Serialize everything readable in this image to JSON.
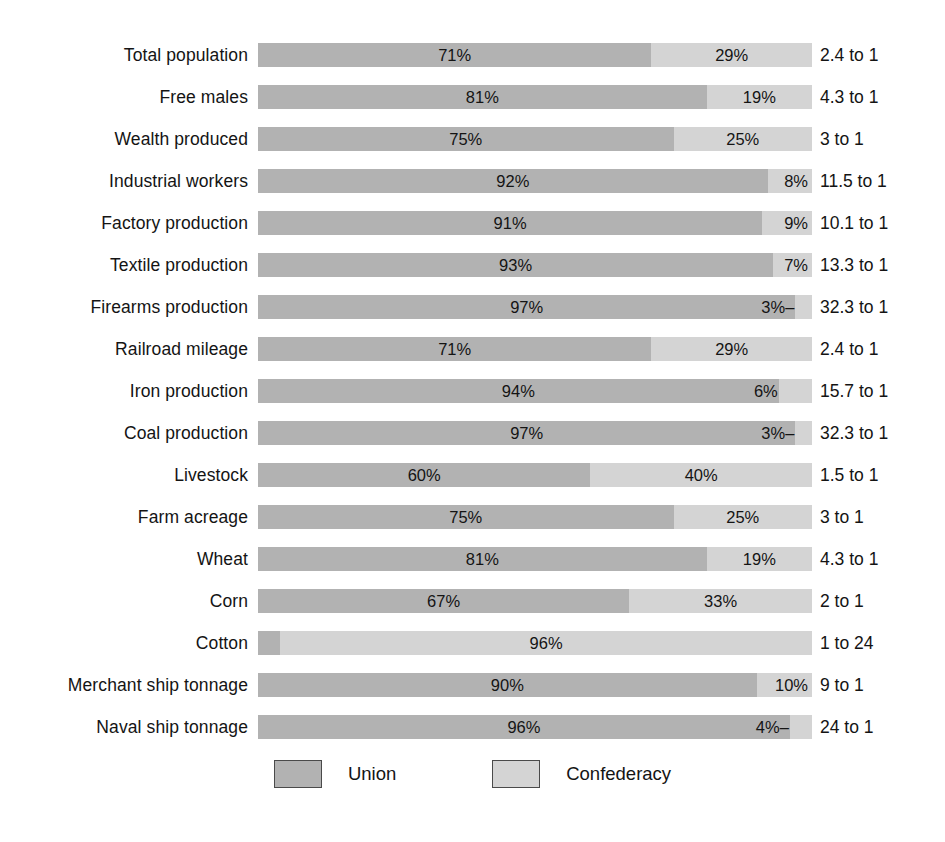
{
  "chart_data": {
    "type": "bar",
    "subtype": "stacked-horizontal-100",
    "title": "",
    "xlabel": "",
    "ylabel": "",
    "xlim": [
      0,
      100
    ],
    "grid": false,
    "legend_position": "bottom-center",
    "categories": [
      "Total population",
      "Free males",
      "Wealth produced",
      "Industrial workers",
      "Factory production",
      "Textile production",
      "Firearms production",
      "Railroad mileage",
      "Iron production",
      "Coal production",
      "Livestock",
      "Farm acreage",
      "Wheat",
      "Corn",
      "Cotton",
      "Merchant ship tonnage",
      "Naval ship tonnage"
    ],
    "series": [
      {
        "name": "Union",
        "color": "#b2b2b2",
        "values": [
          71,
          81,
          75,
          92,
          91,
          93,
          97,
          71,
          94,
          97,
          60,
          75,
          81,
          67,
          4,
          90,
          96
        ]
      },
      {
        "name": "Confederacy",
        "color": "#d4d4d4",
        "values": [
          29,
          19,
          25,
          8,
          9,
          7,
          3,
          29,
          6,
          3,
          40,
          25,
          19,
          33,
          96,
          10,
          4
        ]
      }
    ],
    "ratios": [
      "2.4 to 1",
      "4.3 to 1",
      "3 to 1",
      "11.5 to 1",
      "10.1 to 1",
      "13.3 to 1",
      "32.3 to 1",
      "2.4 to 1",
      "15.7 to 1",
      "32.3 to 1",
      "1.5 to 1",
      "3 to 1",
      "4.3 to 1",
      "2 to 1",
      "1 to 24",
      "9 to 1",
      "24 to 1"
    ]
  },
  "rows": [
    {
      "label": "Total population",
      "union_pct": 71,
      "conf_pct": 29,
      "union_label": "71%",
      "conf_label": "29%",
      "union_label_style": "pct-center",
      "conf_label_style": "pct-center",
      "ratio": "2.4 to 1"
    },
    {
      "label": "Free males",
      "union_pct": 81,
      "conf_pct": 19,
      "union_label": "81%",
      "conf_label": "19%",
      "union_label_style": "pct-center",
      "conf_label_style": "pct-center",
      "ratio": "4.3 to 1"
    },
    {
      "label": "Wealth produced",
      "union_pct": 75,
      "conf_pct": 25,
      "union_label": "75%",
      "conf_label": "25%",
      "union_label_style": "pct-center",
      "conf_label_style": "pct-center",
      "ratio": "3 to 1"
    },
    {
      "label": "Industrial workers",
      "union_pct": 92,
      "conf_pct": 8,
      "union_label": "92%",
      "conf_label": "8%",
      "union_label_style": "pct-center",
      "conf_label_style": "pct-right-inner",
      "ratio": "11.5 to 1"
    },
    {
      "label": "Factory production",
      "union_pct": 91,
      "conf_pct": 9,
      "union_label": "91%",
      "conf_label": "9%",
      "union_label_style": "pct-center",
      "conf_label_style": "pct-right-inner",
      "ratio": "10.1 to 1"
    },
    {
      "label": "Textile production",
      "union_pct": 93,
      "conf_pct": 7,
      "union_label": "93%",
      "conf_label": "7%",
      "union_label_style": "pct-center",
      "conf_label_style": "pct-right-inner",
      "ratio": "13.3 to 1"
    },
    {
      "label": "Firearms production",
      "union_pct": 97,
      "conf_pct": 3,
      "union_label": "97%",
      "conf_label": "3%",
      "union_label_style": "pct-center",
      "conf_label_style": "pct-left-outside",
      "conf_leader": "right",
      "ratio": "32.3 to 1"
    },
    {
      "label": "Railroad mileage",
      "union_pct": 71,
      "conf_pct": 29,
      "union_label": "71%",
      "conf_label": "29%",
      "union_label_style": "pct-center",
      "conf_label_style": "pct-center",
      "ratio": "2.4 to 1"
    },
    {
      "label": "Iron production",
      "union_pct": 94,
      "conf_pct": 6,
      "union_label": "94%",
      "conf_label": "6%",
      "union_label_style": "pct-center",
      "conf_label_style": "pct-left-outside",
      "ratio": "15.7 to 1"
    },
    {
      "label": "Coal production",
      "union_pct": 97,
      "conf_pct": 3,
      "union_label": "97%",
      "conf_label": "3%",
      "union_label_style": "pct-center",
      "conf_label_style": "pct-left-outside",
      "conf_leader": "right",
      "ratio": "32.3 to 1"
    },
    {
      "label": "Livestock",
      "union_pct": 60,
      "conf_pct": 40,
      "union_label": "60%",
      "conf_label": "40%",
      "union_label_style": "pct-center",
      "conf_label_style": "pct-center",
      "ratio": "1.5 to 1"
    },
    {
      "label": "Farm acreage",
      "union_pct": 75,
      "conf_pct": 25,
      "union_label": "75%",
      "conf_label": "25%",
      "union_label_style": "pct-center",
      "conf_label_style": "pct-center",
      "ratio": "3 to 1"
    },
    {
      "label": "Wheat",
      "union_pct": 81,
      "conf_pct": 19,
      "union_label": "81%",
      "conf_label": "19%",
      "union_label_style": "pct-center",
      "conf_label_style": "pct-center",
      "ratio": "4.3 to 1"
    },
    {
      "label": "Corn",
      "union_pct": 67,
      "conf_pct": 33,
      "union_label": "67%",
      "conf_label": "33%",
      "union_label_style": "pct-center",
      "conf_label_style": "pct-center",
      "ratio": "2 to 1"
    },
    {
      "label": "Cotton",
      "union_pct": 4,
      "conf_pct": 96,
      "union_label": "4%",
      "conf_label": "96%",
      "union_label_style": "pct-right-outside",
      "union_leader": "left",
      "conf_label_style": "pct-center",
      "ratio": "1 to 24"
    },
    {
      "label": "Merchant ship tonnage",
      "union_pct": 90,
      "conf_pct": 10,
      "union_label": "90%",
      "conf_label": "10%",
      "union_label_style": "pct-center",
      "conf_label_style": "pct-right-inner",
      "ratio": "9 to 1"
    },
    {
      "label": "Naval ship tonnage",
      "union_pct": 96,
      "conf_pct": 4,
      "union_label": "96%",
      "conf_label": "4%",
      "union_label_style": "pct-center",
      "conf_label_style": "pct-left-outside",
      "conf_leader": "right",
      "ratio": "24 to 1"
    }
  ],
  "legend": {
    "items": [
      {
        "label": "Union",
        "color": "#b2b2b2"
      },
      {
        "label": "Confederacy",
        "color": "#d4d4d4"
      }
    ]
  }
}
